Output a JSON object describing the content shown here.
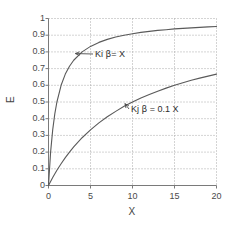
{
  "chart_data": {
    "type": "line",
    "title": "",
    "xlabel": "X",
    "ylabel": "E",
    "xlim": [
      0,
      20
    ],
    "ylim": [
      0,
      1
    ],
    "grid": true,
    "legend_position": "inline-annotations",
    "x_ticks": [
      "0",
      "5",
      "10",
      "15",
      "20"
    ],
    "x_tick_values": [
      0,
      5,
      10,
      15,
      20
    ],
    "y_ticks": [
      "0",
      "0.1",
      "0.2",
      "0.3",
      "0.4",
      "0.5",
      "0.6",
      "0.7",
      "0.8",
      "0.9",
      "1"
    ],
    "y_tick_values": [
      0,
      0.1,
      0.2,
      0.3,
      0.4,
      0.5,
      0.6,
      0.7,
      0.8,
      0.9,
      1
    ],
    "series": [
      {
        "name": "Ki β= X",
        "formula": "E = X / (1 + X)",
        "color": "#5a5a5a",
        "x": [
          0,
          0.25,
          0.5,
          0.75,
          1,
          1.5,
          2,
          2.5,
          3,
          4,
          5,
          6,
          7,
          8,
          9,
          10,
          11,
          12,
          13,
          14,
          15,
          16,
          17,
          18,
          19,
          20
        ],
        "values": [
          0,
          0.2,
          0.333,
          0.429,
          0.5,
          0.6,
          0.667,
          0.714,
          0.75,
          0.8,
          0.833,
          0.857,
          0.875,
          0.889,
          0.9,
          0.909,
          0.917,
          0.923,
          0.929,
          0.933,
          0.938,
          0.941,
          0.944,
          0.947,
          0.95,
          0.952
        ]
      },
      {
        "name": "Kj β = 0.1 X",
        "formula": "E = 0.1X / (1 + 0.1X)",
        "color": "#5a5a5a",
        "x": [
          0,
          0.5,
          1,
          1.5,
          2,
          2.5,
          3,
          4,
          5,
          6,
          7,
          8,
          9,
          10,
          11,
          12,
          13,
          14,
          15,
          16,
          17,
          18,
          19,
          20
        ],
        "values": [
          0,
          0.048,
          0.091,
          0.13,
          0.167,
          0.2,
          0.231,
          0.286,
          0.333,
          0.375,
          0.412,
          0.444,
          0.474,
          0.5,
          0.524,
          0.545,
          0.565,
          0.583,
          0.6,
          0.615,
          0.63,
          0.643,
          0.655,
          0.667
        ]
      }
    ],
    "annotations": [
      {
        "id": "ki",
        "label_prefix": "Ki ",
        "label_beta": "β",
        "label_suffix": "= X",
        "points_to_series": "Ki β= X",
        "anchor_x": 3.2,
        "anchor_y": 0.79
      },
      {
        "id": "kj",
        "label_prefix": "Kj ",
        "label_beta": "β",
        "label_suffix": " = 0.1 X",
        "points_to_series": "Kj β = 0.1 X",
        "anchor_x": 9.1,
        "anchor_y": 0.49
      }
    ]
  },
  "style": {
    "grid_color": "#a8a8a8",
    "axis_color": "#7a7a7a",
    "curve_color": "#5a5a5a",
    "background": "#ffffff",
    "text_color": "#3a3a3a"
  }
}
